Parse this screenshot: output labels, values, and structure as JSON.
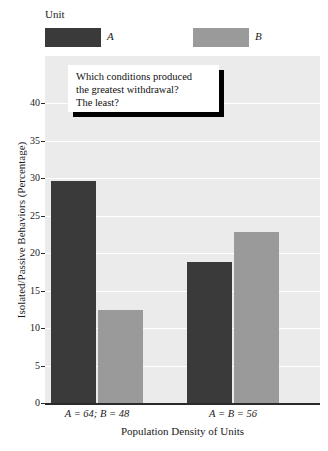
{
  "chart_data": {
    "type": "bar",
    "title": "",
    "subtitle": "",
    "xlabel": "Population Density of Units",
    "ylabel": "Isolated/Passive Behaviors (Percentage)",
    "categories": [
      "A = 64; B = 48",
      "A = B = 56"
    ],
    "series": [
      {
        "name": "A",
        "values": [
          29.6,
          18.8
        ],
        "color": "#3a3a3a"
      },
      {
        "name": "B",
        "values": [
          12.4,
          22.8
        ],
        "color": "#9a9a9a"
      }
    ],
    "ylim": [
      0,
      42
    ],
    "yticks": [
      0,
      5,
      10,
      15,
      20,
      25,
      30,
      35,
      40
    ],
    "ytick_labels": [
      "0",
      "5",
      "10",
      "15",
      "20",
      "25",
      "30",
      "35",
      "40"
    ],
    "grid": "horizontal-white",
    "legend": {
      "title": "Unit",
      "position": "above-plot",
      "entries": [
        "A",
        "B"
      ]
    },
    "plot_background": "#ebebeb",
    "gridline_color": "#ffffff"
  },
  "legend": {
    "title": "Unit",
    "entries": [
      {
        "label": "A",
        "color": "#3a3a3a"
      },
      {
        "label": "B",
        "color": "#9a9a9a"
      }
    ]
  },
  "axes": {
    "y_title": "Isolated/Passive Behaviors (Percentage)",
    "x_title": "Population Density of Units",
    "y_ticks": [
      "0",
      "5",
      "10",
      "15",
      "20",
      "25",
      "30",
      "35",
      "40"
    ],
    "x_ticks": [
      "A = 64; B = 48",
      "A = B = 56"
    ]
  },
  "callout": {
    "lines": [
      "Which conditions produced",
      "the greatest withdrawal?",
      "The least?"
    ]
  }
}
